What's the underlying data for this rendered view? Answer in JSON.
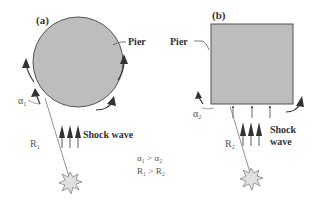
{
  "panels": {
    "a": {
      "label": "(a)",
      "pier_label": "Pier",
      "shape": "circle",
      "angle_label": "α",
      "angle_sub": "1",
      "distance_label": "R",
      "distance_sub": "1",
      "shock_label": "Shock wave"
    },
    "b": {
      "label": "(b)",
      "pier_label": "Pier",
      "shape": "square",
      "angle_label": "α",
      "angle_sub": "2",
      "distance_label": "R",
      "distance_sub": "2",
      "shock_label_line1": "Shock",
      "shock_label_line2": "wave"
    }
  },
  "relations": {
    "line1": "α₁ > α₂",
    "line2": "R₁ > R₂"
  },
  "colors": {
    "pier_fill": "#bdbdbd",
    "pier_stroke": "#555555",
    "arrow": "#333333",
    "line": "#777777",
    "text": "#333333"
  }
}
